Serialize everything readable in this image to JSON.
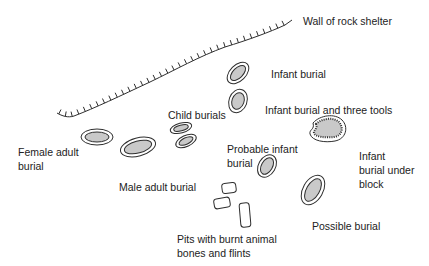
{
  "diagram": {
    "colors": {
      "line": "#2e2e2e",
      "fill": "#c9c9c9",
      "text": "#222222"
    },
    "labels": {
      "wall": "Wall of rock shelter",
      "infant_burial": "Infant burial",
      "infant_burial_tools": "Infant burial and three tools",
      "child_burials": "Child burials",
      "female_adult_1": "Female adult",
      "female_adult_2": "burial",
      "male_adult": "Male adult burial",
      "probable_infant_1": "Probable infant",
      "probable_infant_2": "burial",
      "infant_under_block_1": "Infant",
      "infant_under_block_2": "burial under",
      "infant_under_block_3": "block",
      "possible_burial": "Possible burial",
      "pits_1": "Pits with burnt animal",
      "pits_2": "bones and flints"
    }
  }
}
